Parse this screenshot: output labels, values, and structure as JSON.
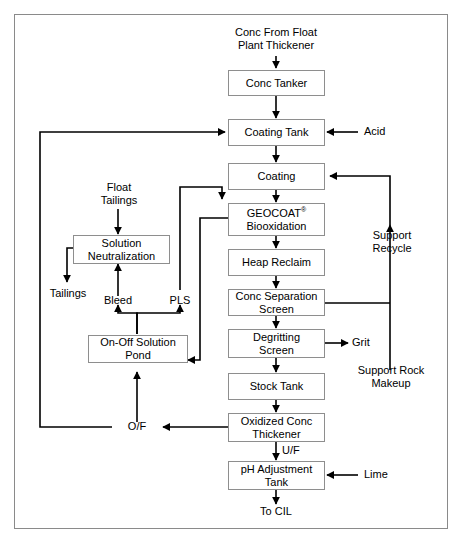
{
  "diagram": {
    "title_present": false,
    "nodes": [
      {
        "id": "conc_tanker",
        "label": "Conc Tanker"
      },
      {
        "id": "coating_tank",
        "label": "Coating Tank"
      },
      {
        "id": "coating",
        "label": "Coating"
      },
      {
        "id": "geocoat",
        "label": "GEOCOAT®\nBiooxidation"
      },
      {
        "id": "heap_reclaim",
        "label": "Heap Reclaim"
      },
      {
        "id": "conc_separation",
        "label": "Conc Separation\nScreen"
      },
      {
        "id": "degritting",
        "label": "Degritting\nScreen"
      },
      {
        "id": "stock_tank",
        "label": "Stock Tank"
      },
      {
        "id": "oxidized_conc",
        "label": "Oxidized Conc\nThickener"
      },
      {
        "id": "ph_adjustment",
        "label": "pH Adjustment\nTank"
      },
      {
        "id": "solution_neutralization",
        "label": "Solution\nNeutralization"
      },
      {
        "id": "on_off_pond",
        "label": "On-Off Solution\nPond"
      }
    ],
    "labels": [
      {
        "id": "feed",
        "text": "Conc From Float\nPlant Thickener"
      },
      {
        "id": "acid",
        "text": "Acid"
      },
      {
        "id": "float_tailings",
        "text": "Float\nTailings"
      },
      {
        "id": "tailings",
        "text": "Tailings"
      },
      {
        "id": "bleed",
        "text": "Bleed"
      },
      {
        "id": "pls",
        "text": "PLS"
      },
      {
        "id": "support_recycle",
        "text": "Support\nRecycle"
      },
      {
        "id": "grit",
        "text": "Grit"
      },
      {
        "id": "support_rock",
        "text": "Support Rock\nMakeup"
      },
      {
        "id": "overflow",
        "text": "O/F"
      },
      {
        "id": "underflow",
        "text": "U/F"
      },
      {
        "id": "lime",
        "text": "Lime"
      },
      {
        "id": "to_cil",
        "text": "To CIL"
      }
    ],
    "colors": {
      "stroke": "#000000",
      "box_border": "#8e8e8e",
      "frame_border": "#8a8a8a",
      "background": "#ffffff",
      "text": "#000000"
    }
  }
}
